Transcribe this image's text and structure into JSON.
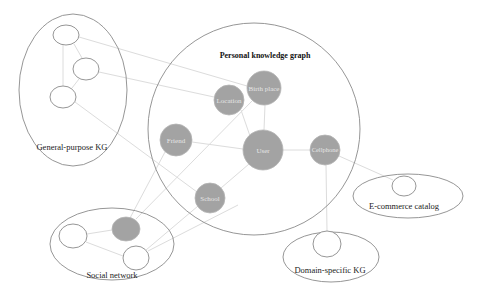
{
  "diagram": {
    "title": "Personal knowledge graph",
    "regions": {
      "general_purpose": {
        "label": "General-purpose KG"
      },
      "social": {
        "label": "Social network"
      },
      "ecommerce": {
        "label": "E-commerce catalog"
      },
      "domain_specific": {
        "label": "Domain-specific KG"
      }
    },
    "nodes": {
      "user": "User",
      "birth_place": "Birth place",
      "location": "Location",
      "friend": "Friend",
      "school": "School",
      "cellphone": "Cellphone"
    },
    "colors": {
      "personal_node_fill": "#a3a3a3",
      "external_node_fill": "#ffffff",
      "outline": "#8a8a8a",
      "edge": "#dcdcdc"
    }
  }
}
